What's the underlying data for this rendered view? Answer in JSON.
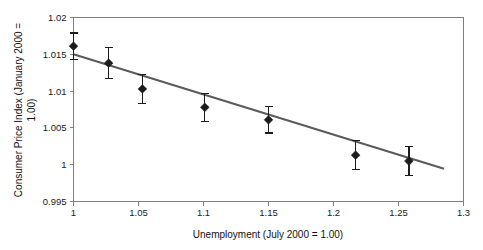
{
  "chart_data": {
    "type": "scatter",
    "title": "",
    "xlabel": "Unemployment (July 2000 = 1.00)",
    "ylabel": "Consumer Price Index (January 2000 = 1.00)",
    "ylabel_line1": "Consumer Price Index (January 2000 =",
    "ylabel_line2": "1.00)",
    "xlim": [
      1.0,
      1.3
    ],
    "ylim": [
      0.995,
      1.02
    ],
    "xticks": [
      "1",
      "1.05",
      "1.1",
      "1.15",
      "1.2",
      "1.25",
      "1.3"
    ],
    "xtick_values": [
      1.0,
      1.05,
      1.1,
      1.15,
      1.2,
      1.25,
      1.3
    ],
    "yticks": [
      "1.02",
      "1.015",
      "1.01",
      "1.005",
      "1",
      "0.995"
    ],
    "ytick_values": [
      1.02,
      1.015,
      1.01,
      1.005,
      1.0,
      0.995
    ],
    "grid": false,
    "legend": false,
    "series": [
      {
        "name": "observations",
        "marker": "diamond",
        "color": "#1c1c1c",
        "x": [
          1.0,
          1.027,
          1.053,
          1.101,
          1.15,
          1.217,
          1.258
        ],
        "y": [
          1.0161,
          1.0138,
          1.0103,
          1.0078,
          1.0061,
          1.0013,
          1.0005
        ],
        "yerr": [
          0.0018,
          0.0021,
          0.002,
          0.0019,
          0.0018,
          0.002,
          0.002
        ]
      }
    ],
    "trendline": {
      "name": "fitted regression line",
      "color": "#5a5a5a",
      "x": [
        1.0,
        1.285
      ],
      "y": [
        1.015,
        0.99945
      ]
    }
  }
}
